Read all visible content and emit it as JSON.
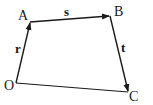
{
  "diagram": {
    "type": "vector-quadrilateral",
    "points": {
      "O": {
        "label": "O",
        "x": 16,
        "y": 83
      },
      "A": {
        "label": "A",
        "x": 30,
        "y": 22
      },
      "B": {
        "label": "B",
        "x": 110,
        "y": 16
      },
      "C": {
        "label": "C",
        "x": 128,
        "y": 92
      }
    },
    "vectors": [
      {
        "from": "O",
        "to": "A",
        "label": "r"
      },
      {
        "from": "A",
        "to": "B",
        "label": "s"
      },
      {
        "from": "B",
        "to": "C",
        "label": "t"
      }
    ],
    "segments": [
      {
        "from": "O",
        "to": "C"
      }
    ],
    "colors": {
      "stroke": "#1a1a1a",
      "background": "#ffffff"
    }
  }
}
